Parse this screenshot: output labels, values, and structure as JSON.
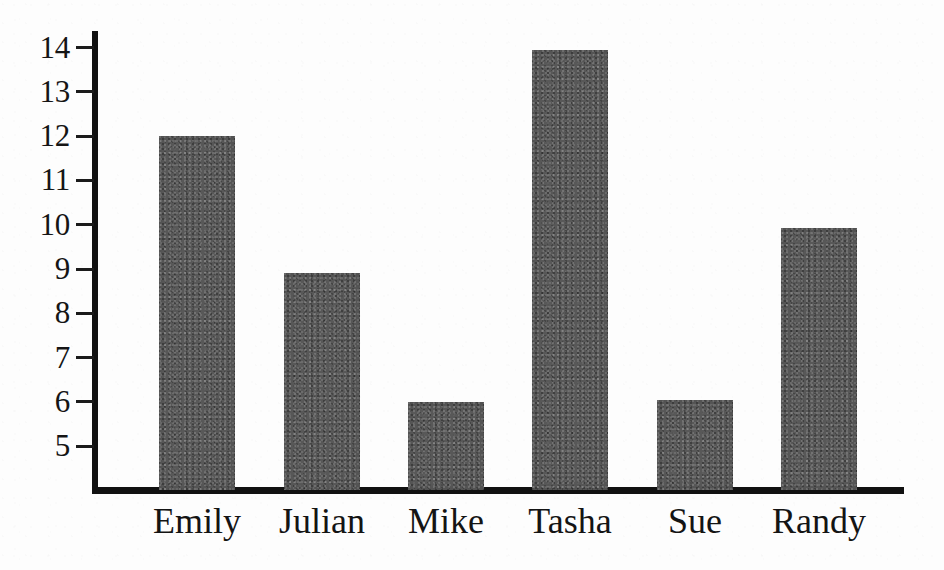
{
  "chart_data": {
    "type": "bar",
    "title": "",
    "subtitle": "",
    "xlabel": "",
    "ylabel": "",
    "categories": [
      "Emily",
      "Julian",
      "Mike",
      "Tasha",
      "Sue",
      "Randy"
    ],
    "values": [
      12.0,
      8.9,
      6.0,
      13.95,
      6.05,
      9.93
    ],
    "series": [
      {
        "name": "",
        "values": [
          12.0,
          8.9,
          6.0,
          13.95,
          6.05,
          9.93
        ]
      }
    ],
    "ylim": [
      4.0,
      14.5
    ],
    "y_ticks": [
      5,
      6,
      7,
      8,
      9,
      10,
      11,
      12,
      13,
      14
    ],
    "y_tick_labels": [
      "5",
      "6",
      "7",
      "8",
      "9",
      "10",
      "11",
      "12",
      "13",
      "14"
    ],
    "x_ticks": [],
    "grid": false,
    "legend": false,
    "legend_position": "none",
    "annotations": [],
    "bar_color": "#585858",
    "axis_color": "#111111",
    "background_color": "#fdfdfd",
    "text_color": "#141414"
  },
  "figure": {
    "axis_top_value": 14.5,
    "baseline_value": 4.0
  }
}
